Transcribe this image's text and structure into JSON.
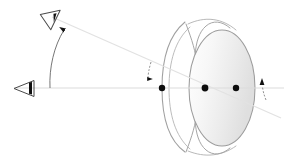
{
  "figure": {
    "title": "Schematic eye with visual axis, optical axis and cardinal points",
    "type": "optical-ray-diagram",
    "width": 286,
    "height": 158,
    "background": "#ffffff"
  },
  "palette": {
    "ray_line": "#e2e2e2",
    "axis_line": "#dcdcdc",
    "eye_outline": "#9a9a9a",
    "lens_outline": "#9a9a9a",
    "lens_fill_light": "#fbfbfb",
    "lens_fill_dark": "#e6e6e6",
    "marker_black": "#0d0d0d",
    "angle_arc": "#6f6f6f"
  },
  "elements": {
    "observer_eye_upper": {
      "name": "observer-eye-upper",
      "shape": "triangular-eye-glyph",
      "x": 42,
      "y": 16,
      "rotation_deg": -28,
      "points_toward": "eye-model"
    },
    "observer_eye_lower": {
      "name": "observer-eye-lower",
      "shape": "triangular-eye-glyph",
      "x": 18,
      "y": 87,
      "rotation_deg": 0,
      "points_toward": "eye-model"
    },
    "optical_axis": {
      "name": "optical-axis",
      "x1": 14,
      "y1": 88,
      "x2": 284,
      "y2": 88,
      "style": "solid",
      "color": "#dcdcdc"
    },
    "visual_axis": {
      "name": "visual-axis",
      "x1": 52,
      "y1": 17,
      "x2": 281,
      "y2": 118,
      "style": "solid",
      "color": "#e2e2e2",
      "slope_deg": 23.8
    },
    "cardinal_points": [
      {
        "name": "anterior-corneal-point",
        "x": 162,
        "y": 88,
        "r": 3.2
      },
      {
        "name": "nodal-point",
        "x": 205,
        "y": 88,
        "r": 3.4
      },
      {
        "name": "posterior-point",
        "x": 236,
        "y": 88,
        "r": 3.2
      }
    ],
    "angle_markers": [
      {
        "name": "angle-alpha-arc-left",
        "description": "arc between optical axis and visual axis at observer",
        "cx": 52,
        "cy": 88,
        "radius": 54,
        "start_deg": 180,
        "end_deg": 252,
        "arrow_at": "end"
      },
      {
        "name": "angle-kappa-arc-right",
        "description": "small arc at exit showing angle between axes",
        "cx": 262,
        "cy": 88,
        "radius": 14,
        "start_deg": 270,
        "end_deg": 320,
        "arrow_at": "start"
      },
      {
        "name": "angle-arc-center",
        "description": "short dashed arc at cornea entry",
        "cx": 150,
        "cy": 66,
        "radius": 11,
        "start_deg": 250,
        "end_deg": 295,
        "arrow_at": "end"
      }
    ],
    "eye_model": {
      "name": "schematic-eye-model",
      "cornea_outer": {
        "name": "cornea-outer-arc",
        "cx": 250,
        "cy": 88,
        "rx": 88,
        "ry": 72
      },
      "cornea_inner": {
        "name": "cornea-inner-arc",
        "cx": 252,
        "cy": 88,
        "rx": 82,
        "ry": 66
      },
      "iris_upper": {
        "name": "iris-upper-leaf"
      },
      "iris_lower": {
        "name": "iris-lower-leaf"
      },
      "crystalline_lens": {
        "name": "crystalline-lens",
        "cx": 222,
        "cy": 88,
        "rx": 33,
        "ry": 58
      }
    }
  }
}
